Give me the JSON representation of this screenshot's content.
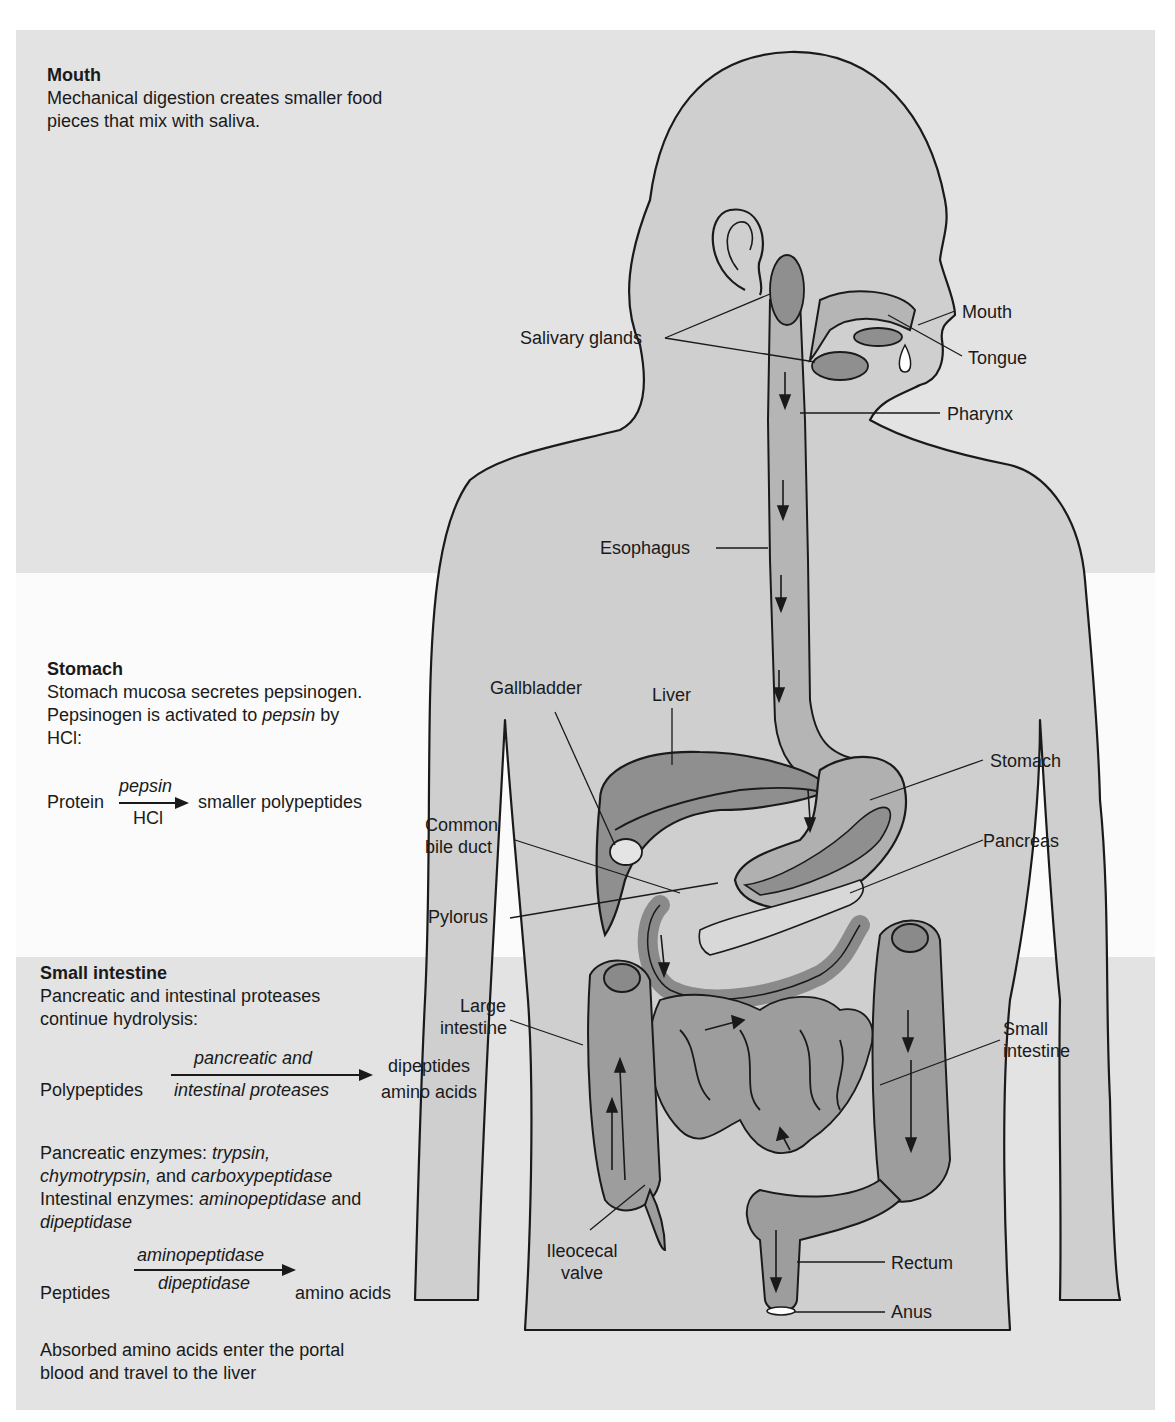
{
  "colors": {
    "band_gray": "#e3e3e3",
    "band_white": "#fbfbfb",
    "body_fill": "#cfcfcf",
    "organ_fill": "#a8a8a8",
    "organ_dark": "#8a8a8a",
    "outline": "#1a1a1a"
  },
  "panels": {
    "mouth": {
      "heading": "Mouth",
      "lines": [
        "Mechanical digestion creates smaller food",
        "pieces that mix with saliva."
      ]
    },
    "stomach": {
      "heading": "Stomach",
      "line1": "Stomach mucosa secretes pepsinogen.",
      "line2_pre": "Pepsinogen is activated to ",
      "line2_em": "pepsin",
      "line2_post": " by",
      "line3": "HCl:",
      "equation": {
        "substrate": "Protein",
        "over": "pepsin",
        "under": "HCl",
        "product": "smaller polypeptides"
      }
    },
    "small_intestine": {
      "heading": "Small intestine",
      "lines": [
        "Pancreatic and intestinal proteases",
        "continue hydrolysis:"
      ],
      "equation1": {
        "substrate": "Polypeptides",
        "over": "pancreatic and",
        "under": "intestinal proteases",
        "product_line1": "dipeptides",
        "product_line2": "amino acids"
      },
      "pancreatic_enzymes_label": "Pancreatic enzymes: ",
      "pancreatic_enzymes": [
        "trypsin,",
        "chymotrypsin,",
        "carboxypeptidase"
      ],
      "and_word": " and ",
      "intestinal_enzymes_label": "Intestinal enzymes: ",
      "intestinal_enzymes": [
        "aminopeptidase",
        "dipeptidase"
      ],
      "equation2": {
        "substrate": "Peptides",
        "over": "aminopeptidase",
        "under": "dipeptidase",
        "product": "amino acids"
      },
      "closing": [
        "Absorbed amino acids enter the portal",
        "blood and travel to the liver"
      ]
    }
  },
  "anatomy_labels": {
    "mouth": "Mouth",
    "salivary_glands": "Salivary glands",
    "tongue": "Tongue",
    "pharynx": "Pharynx",
    "esophagus": "Esophagus",
    "gallbladder": "Gallbladder",
    "liver": "Liver",
    "stomach": "Stomach",
    "common_bile_duct_1": "Common",
    "common_bile_duct_2": "bile duct",
    "pancreas": "Pancreas",
    "pylorus": "Pylorus",
    "large_intestine_1": "Large",
    "large_intestine_2": "intestine",
    "small_intestine_1": "Small",
    "small_intestine_2": "intestine",
    "ileocecal_valve_1": "Ileocecal",
    "ileocecal_valve_2": "valve",
    "rectum": "Rectum",
    "anus": "Anus"
  }
}
